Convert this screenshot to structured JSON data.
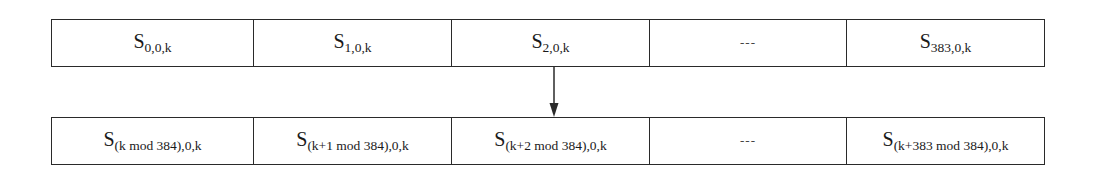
{
  "diagram": {
    "type": "array-rotation",
    "top_row": {
      "cells": [
        {
          "symbol": "S",
          "subscript": "0,0,k"
        },
        {
          "symbol": "S",
          "subscript": "1,0,k"
        },
        {
          "symbol": "S",
          "subscript": "2,0,k"
        },
        {
          "ellipsis": "---"
        },
        {
          "symbol": "S",
          "subscript": "383,0,k"
        }
      ]
    },
    "arrow": {
      "direction": "down",
      "from": "top_row.cells.2",
      "to": "bottom_row.cells.2"
    },
    "bottom_row": {
      "cells": [
        {
          "symbol": "S",
          "subscript": "(k mod 384),0,k"
        },
        {
          "symbol": "S",
          "subscript": "(k+1 mod 384),0,k"
        },
        {
          "symbol": "S",
          "subscript": "(k+2 mod 384),0,k"
        },
        {
          "ellipsis": "---"
        },
        {
          "symbol": "S",
          "subscript": "(k+383 mod 384),0,k"
        }
      ]
    },
    "colors": {
      "line": "#2a2a2a",
      "text": "#1a1a1a",
      "background": "#ffffff"
    }
  }
}
